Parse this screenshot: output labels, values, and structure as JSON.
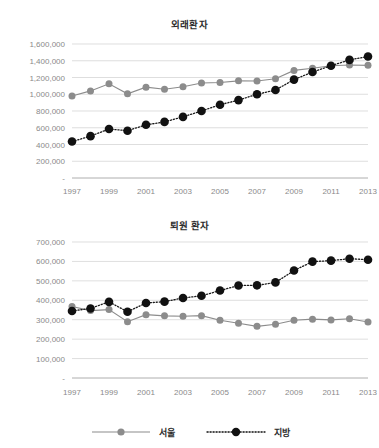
{
  "charts": [
    {
      "title": "외래환자",
      "ylabel": "",
      "xlabel": "",
      "ylim": [
        0,
        1600000
      ],
      "ytick_labels": [
        "1,600,000",
        "1,400,000",
        "1,200,000",
        "1,000,000",
        "800,000",
        "600,000",
        "400,000",
        "200,000",
        "-"
      ],
      "ytick_values": [
        1600000,
        1400000,
        1200000,
        1000000,
        800000,
        600000,
        400000,
        200000,
        0
      ],
      "xtick_labels": [
        "1997",
        "1999",
        "2001",
        "2003",
        "2005",
        "2007",
        "2009",
        "2011",
        "2013"
      ],
      "xtick_values": [
        1997,
        1999,
        2001,
        2003,
        2005,
        2007,
        2009,
        2011,
        2013
      ]
    },
    {
      "title": "퇴원 환자",
      "ylabel": "",
      "xlabel": "",
      "ylim": [
        0,
        700000
      ],
      "ytick_labels": [
        "700,000",
        "600,000",
        "500,000",
        "400,000",
        "300,000",
        "200,000",
        "100,000",
        "-"
      ],
      "ytick_values": [
        700000,
        600000,
        500000,
        400000,
        300000,
        200000,
        100000,
        0
      ],
      "xtick_labels": [
        "1997",
        "1999",
        "2001",
        "2003",
        "2005",
        "2007",
        "2009",
        "2011",
        "2013"
      ],
      "xtick_values": [
        1997,
        1999,
        2001,
        2003,
        2005,
        2007,
        2009,
        2011,
        2013
      ]
    }
  ],
  "legend": {
    "position": "bottom-center",
    "entries": [
      {
        "label": "서울",
        "color": "#8c8c8c",
        "style": "solid-line-with-circle-marker",
        "marker": "circle"
      },
      {
        "label": "지방",
        "color": "#111111",
        "style": "dotted-line-with-circle-marker",
        "marker": "circle"
      }
    ]
  },
  "chart_data": [
    {
      "type": "line",
      "title": "외래환자",
      "xlabel": "",
      "ylabel": "",
      "x": [
        1997,
        1998,
        1999,
        2000,
        2001,
        2002,
        2003,
        2004,
        2005,
        2006,
        2007,
        2008,
        2009,
        2010,
        2011,
        2012,
        2013
      ],
      "ylim": [
        0,
        1600000
      ],
      "xlim": [
        1997,
        2013
      ],
      "grid": true,
      "legend_position": "bottom-center",
      "series": [
        {
          "name": "서울",
          "color": "#8c8c8c",
          "linestyle": "solid",
          "marker": "circle",
          "values": [
            980000,
            1040000,
            1125000,
            1005000,
            1085000,
            1060000,
            1090000,
            1135000,
            1140000,
            1160000,
            1158000,
            1185000,
            1285000,
            1310000,
            1340000,
            1350000,
            1345000
          ]
        },
        {
          "name": "지방",
          "color": "#111111",
          "linestyle": "dotted",
          "marker": "circle",
          "values": [
            435000,
            500000,
            585000,
            565000,
            635000,
            670000,
            730000,
            800000,
            875000,
            930000,
            1000000,
            1050000,
            1175000,
            1265000,
            1340000,
            1410000,
            1450000
          ]
        }
      ]
    },
    {
      "type": "line",
      "title": "퇴원 환자",
      "xlabel": "",
      "ylabel": "",
      "x": [
        1997,
        1998,
        1999,
        2000,
        2001,
        2002,
        2003,
        2004,
        2005,
        2006,
        2007,
        2008,
        2009,
        2010,
        2011,
        2012,
        2013
      ],
      "ylim": [
        0,
        700000
      ],
      "xlim": [
        1997,
        2013
      ],
      "grid": true,
      "legend_position": "bottom-center",
      "series": [
        {
          "name": "서울",
          "color": "#8c8c8c",
          "linestyle": "solid",
          "marker": "circle",
          "values": [
            368000,
            347000,
            352000,
            290000,
            326000,
            320000,
            318000,
            321000,
            297000,
            282000,
            266000,
            277000,
            297000,
            303000,
            299000,
            305000,
            288000
          ]
        },
        {
          "name": "지방",
          "color": "#111111",
          "linestyle": "dotted",
          "marker": "circle",
          "values": [
            345000,
            358000,
            392000,
            341000,
            386000,
            393000,
            412000,
            423000,
            450000,
            476000,
            477000,
            492000,
            553000,
            599000,
            604000,
            614000,
            609000
          ]
        }
      ]
    }
  ]
}
